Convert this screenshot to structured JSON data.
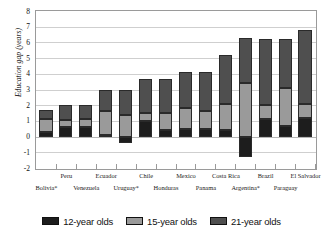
{
  "chart_data": {
    "type": "bar",
    "subtype": "stacked-bar",
    "title": "",
    "xlabel": "",
    "ylabel": "Education gap (years)",
    "ylim": [
      -2,
      8
    ],
    "yticks": [
      8,
      7,
      6,
      5,
      4,
      3,
      2,
      1,
      0,
      -1,
      -2
    ],
    "ytick_labels": [
      "8",
      "7",
      "6",
      "5",
      "4",
      "3",
      "2",
      "1",
      "0",
      "-1",
      "-2"
    ],
    "grid": true,
    "grid_axis": "y",
    "legend_position": "bottom",
    "categories": [
      "Bolivia*",
      "Peru",
      "Venezuela",
      "Ecuador",
      "Uruguay*",
      "Chile",
      "Honduras",
      "Mexico",
      "Panama",
      "Costa Rica",
      "Argentina*",
      "Brazil",
      "Paraguay",
      "El Salvador"
    ],
    "category_rows": {
      "top": [
        "",
        "Peru",
        "",
        "Ecuador",
        "",
        "Chile",
        "",
        "Mexico",
        "",
        "Costa Rica",
        "",
        "Brazil",
        "",
        "El Salvador"
      ],
      "bottom": [
        "Bolivia*",
        "",
        "Venezuela",
        "",
        "Uruguay*",
        "",
        "Honduras",
        "",
        "Panama",
        "",
        "Argentina*",
        "",
        "Paraguay",
        ""
      ]
    },
    "series": [
      {
        "name": "12-year olds",
        "color": "#1d1d1d",
        "values": [
          0.3,
          0.6,
          0.6,
          0.1,
          -0.4,
          1.0,
          0.4,
          0.5,
          0.5,
          0.4,
          -1.3,
          1.1,
          0.7,
          1.2
        ]
      },
      {
        "name": "15-year olds",
        "color": "#9a9a9a",
        "values": [
          0.85,
          0.45,
          0.5,
          1.5,
          1.4,
          0.5,
          1.1,
          1.3,
          1.1,
          1.7,
          3.4,
          0.9,
          2.4,
          0.9
        ]
      },
      {
        "name": "21-year olds",
        "color": "#4f4f4f",
        "values": [
          0.55,
          0.95,
          0.9,
          1.4,
          1.6,
          2.2,
          2.2,
          2.3,
          2.5,
          3.1,
          2.9,
          4.2,
          3.1,
          4.7
        ]
      }
    ],
    "totals": [
      1.7,
      2.0,
      2.0,
      3.0,
      2.6,
      3.7,
      3.7,
      4.1,
      4.1,
      5.2,
      5.0,
      6.2,
      6.2,
      6.8
    ],
    "series_labels": [
      "12-year olds",
      "15-year olds",
      "21-year olds"
    ],
    "colors": {
      "12-year olds": "#1d1d1d",
      "15-year olds": "#9a9a9a",
      "21-year olds": "#4f4f4f",
      "grid": "#cfcfcf",
      "frame": "#9a9a9a",
      "text": "#111111"
    },
    "footnote_marker": "*"
  }
}
